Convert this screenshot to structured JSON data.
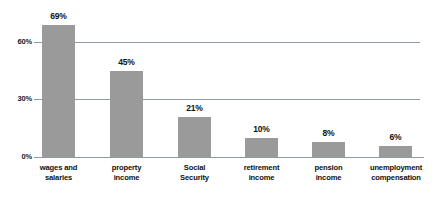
{
  "chart_data": {
    "type": "bar",
    "title": "",
    "subtitle": "",
    "xlabel": "",
    "ylabel": "",
    "ylim": [
      0,
      75
    ],
    "grid": true,
    "legend": false,
    "orientation": "vertical",
    "bar_color": "#9a9a9a",
    "axis_color": "#8f9aa6",
    "value_label_suffix": "%",
    "categories": [
      "wages and\nsalaries",
      "property\nincome",
      "Social\nSecurity",
      "retirement\nincome",
      "pension\nincome",
      "unemployment\ncompensation"
    ],
    "values": [
      69,
      45,
      21,
      10,
      8,
      6
    ],
    "value_labels": [
      "69%",
      "45%",
      "21%",
      "10%",
      "8%",
      "6%"
    ],
    "yticks": [
      0,
      30,
      60
    ],
    "ytick_labels": [
      "0%",
      "30%",
      "60%"
    ]
  }
}
